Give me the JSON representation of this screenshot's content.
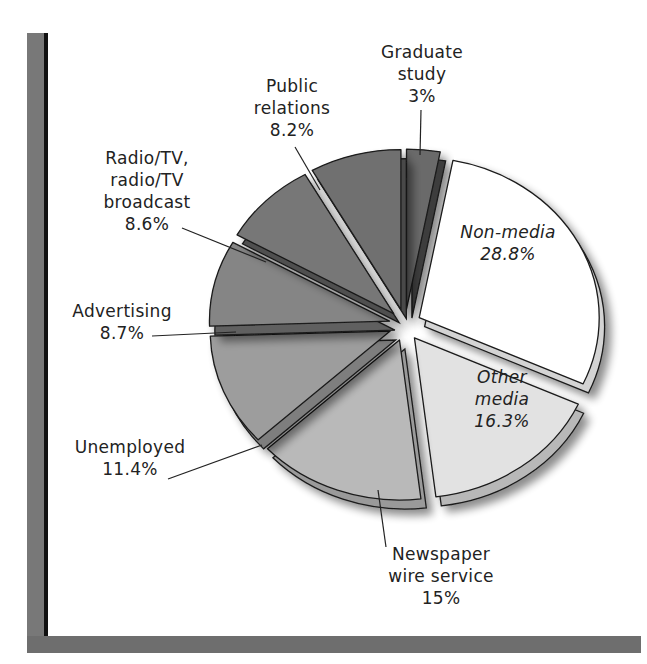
{
  "chart_data": {
    "type": "pie",
    "title": "",
    "variant": "exploded 3D pie",
    "start_angle_deg": -90,
    "direction": "clockwise",
    "slices": [
      {
        "label": "Graduate study",
        "lines": [
          "Graduate",
          "study",
          "3%"
        ],
        "value": 3.0,
        "color": "#6a6a6a",
        "side": "#3c3c3c",
        "label_pos": [
          422,
          58
        ],
        "label_inside": false,
        "leader": [
          [
            421,
            110
          ],
          [
            420,
            155
          ]
        ]
      },
      {
        "label": "Non-media",
        "lines": [
          "Non-media",
          "28.8%"
        ],
        "value": 28.8,
        "color": "#ffffff",
        "side": "#d4d4d4",
        "label_pos": [
          508,
          238
        ],
        "label_inside": true,
        "leader": null
      },
      {
        "label": "Other media",
        "lines": [
          "Other",
          "media",
          "16.3%"
        ],
        "value": 16.3,
        "color": "#e2e2e2",
        "side": "#b8b8b8",
        "label_pos": [
          502,
          383
        ],
        "label_inside": true,
        "leader": null
      },
      {
        "label": "Newspaper wire service",
        "lines": [
          "Newspaper",
          "wire service",
          "15%"
        ],
        "value": 15.0,
        "color": "#b9b9b9",
        "side": "#9a9a9a",
        "label_pos": [
          441,
          560
        ],
        "label_inside": false,
        "leader": [
          [
            386,
            547
          ],
          [
            378,
            490
          ]
        ]
      },
      {
        "label": "Unemployed",
        "lines": [
          "Unemployed",
          "11.4%"
        ],
        "value": 11.4,
        "color": "#9d9d9d",
        "side": "#7e7e7e",
        "label_pos": [
          130,
          453
        ],
        "label_inside": false,
        "leader": [
          [
            168,
            479
          ],
          [
            262,
            445
          ]
        ]
      },
      {
        "label": "Advertising",
        "lines": [
          "Advertising",
          "8.7%"
        ],
        "value": 8.7,
        "color": "#858585",
        "side": "#606060",
        "label_pos": [
          122,
          317
        ],
        "label_inside": false,
        "leader": [
          [
            152,
            336
          ],
          [
            236,
            332
          ]
        ]
      },
      {
        "label": "Radio/TV, radio/TV broadcast",
        "lines": [
          "Radio/TV,",
          "radio/TV",
          "broadcast",
          "8.6%"
        ],
        "value": 8.6,
        "color": "#777777",
        "side": "#505050",
        "label_pos": [
          147,
          164
        ],
        "label_inside": false,
        "leader": [
          [
            182,
            228
          ],
          [
            266,
            262
          ]
        ]
      },
      {
        "label": "Public relations",
        "lines": [
          "Public",
          "relations",
          "8.2%"
        ],
        "value": 8.2,
        "color": "#6f6f6f",
        "side": "#4a4a4a",
        "label_pos": [
          292,
          92
        ],
        "label_inside": false,
        "leader": [
          [
            295,
            147
          ],
          [
            320,
            190
          ]
        ]
      }
    ],
    "legend": null,
    "axes": null
  },
  "geometry": {
    "cx": 405,
    "cy": 325,
    "rx": 180,
    "ry": 160,
    "explode": 16,
    "depth": 9
  },
  "colors": {
    "frame": "#787878",
    "frame_inner": "#111111",
    "outline": "#1a1a1a",
    "text": "#222222"
  }
}
